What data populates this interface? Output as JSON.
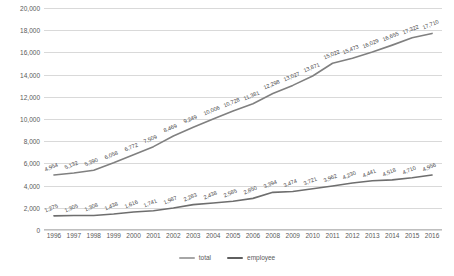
{
  "chart_data": {
    "type": "line",
    "title": "",
    "xlabel": "",
    "ylabel": "Dollars",
    "ylim": [
      0,
      20000
    ],
    "ytick_values": [
      0,
      2000,
      4000,
      6000,
      8000,
      10000,
      12000,
      14000,
      16000,
      18000,
      20000
    ],
    "ytick_labels": [
      "0",
      "2,000",
      "4,000",
      "6,000",
      "8,000",
      "10,000",
      "12,000",
      "14,000",
      "16,000",
      "18,000",
      "20,000"
    ],
    "grid": true,
    "legend_position": "bottom",
    "categories": [
      "1996",
      "1997",
      "1998",
      "1999",
      "2000",
      "2001",
      "2002",
      "2003",
      "2004",
      "2005",
      "2006",
      "2008",
      "2009",
      "2010",
      "2011",
      "2012",
      "2013",
      "2014",
      "2015",
      "2016"
    ],
    "series": [
      {
        "name": "total",
        "color": "#808080",
        "values": [
          4954,
          5132,
          5390,
          6058,
          6772,
          7509,
          8469,
          9249,
          10006,
          10728,
          11381,
          12298,
          13027,
          13871,
          15022,
          15473,
          16029,
          16655,
          17322,
          17710
        ],
        "labels": [
          "4,954",
          "5,132",
          "5,390",
          "6,058",
          "6,772",
          "7,509",
          "8,469",
          "9,249",
          "10,006",
          "10,728",
          "11,381",
          "12,298",
          "13,027",
          "13,871",
          "15,022",
          "15,473",
          "16,029",
          "16,655",
          "17,322",
          "17,710"
        ]
      },
      {
        "name": "employee",
        "color": "#6e6e6e",
        "values": [
          1275,
          1305,
          1308,
          1438,
          1616,
          1741,
          1987,
          2283,
          2438,
          2585,
          2850,
          3394,
          3474,
          3721,
          3962,
          4230,
          4441,
          4518,
          4710,
          4956
        ],
        "labels": [
          "1,275",
          "1,305",
          "1,308",
          "1,438",
          "1,616",
          "1,741",
          "1,987",
          "2,283",
          "2,438",
          "2,585",
          "2,850",
          "3,394",
          "3,474",
          "3,721",
          "3,962",
          "4,230",
          "4,441",
          "4,518",
          "4,710",
          "4,956"
        ]
      }
    ],
    "legend": [
      {
        "label": "total",
        "color": "#a6a6a6"
      },
      {
        "label": "employee",
        "color": "#5f5f5f"
      }
    ]
  }
}
